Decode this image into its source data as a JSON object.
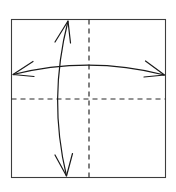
{
  "figure": {
    "title": "",
    "caption": "",
    "background_color": "#ffffff"
  },
  "frame": {
    "name": "square-boundary",
    "x": 11.5,
    "y": 19.5,
    "width": 154,
    "height": 158,
    "stroke_color": "#3d3d3d",
    "stroke_width": 1.1
  },
  "axes": {
    "stroke_color": "#2b2b2b",
    "stroke_width": 1.2,
    "dash_pattern": "5,4",
    "center": {
      "x": 89,
      "y": 99
    },
    "vertical": {
      "name": "vertical-axis-dashed",
      "x": 89,
      "y1": 19.5,
      "y2": 177.5
    },
    "horizontal": {
      "name": "horizontal-axis-dashed",
      "y": 99,
      "x1": 11.5,
      "x2": 165.5
    }
  },
  "arrows": {
    "stroke_color": "#1a1a1a",
    "stroke_width": 1.2,
    "horizontal": {
      "name": "horizontal-double-arrow",
      "label": "horizontal arc arrow",
      "path": "M 13 74.5 Q 89 55.5 164.5 75",
      "curve_direction": "bulges-up",
      "left_tip": {
        "x": 13,
        "y": 74.5
      },
      "right_tip": {
        "x": 164.5,
        "y": 75
      },
      "left_head": "M 13 74.5 L 33 61.5 M 13 74.5 L 34 76.5",
      "right_head": "M 164.5 75 L 145.5 61 M 164.5 75 L 144 77"
    },
    "vertical": {
      "name": "vertical-double-arrow",
      "label": "vertical arc arrow",
      "path": "M 68 21 Q 48 99 66.5 176",
      "curve_direction": "bulges-left",
      "top_tip": {
        "x": 68,
        "y": 21
      },
      "bottom_tip": {
        "x": 66.5,
        "y": 176
      },
      "top_head": "M 68 21 L 55 42 M 68 21 L 70.5 43",
      "bottom_head": "M 66.5 176 L 55 155 M 66.5 176 L 72.5 153.5"
    }
  }
}
